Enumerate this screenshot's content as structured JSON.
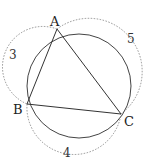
{
  "diagram": {
    "circle": {
      "cx": 79,
      "cy": 86,
      "r": 52
    },
    "points": {
      "A": {
        "label": "A",
        "x": 57,
        "y": 29
      },
      "B": {
        "label": "B",
        "x": 27,
        "y": 104
      },
      "C": {
        "label": "C",
        "x": 121,
        "y": 114
      }
    },
    "sides": {
      "AB": {
        "length_label": "3"
      },
      "BC": {
        "length_label": "4"
      },
      "AC": {
        "length_label": "5"
      }
    }
  }
}
